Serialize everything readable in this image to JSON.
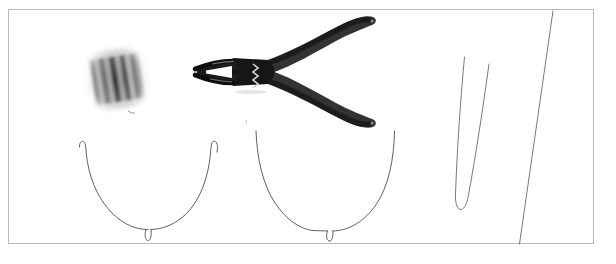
{
  "scene": {
    "title": "Jewellery wire-working materials laid out on a white surface",
    "background_color": "#ffffff",
    "frame_color": "#b9bcbe",
    "alt_text": "Photograph of a spool of wire, a pair of black needle-nose pliers, two U-shaped hooked underwire forms and two long straight wire strands on a plain white background."
  },
  "objects": [
    {
      "id": "wire-spool",
      "label": "Spool of wire",
      "color_dark": "#3c3c3c",
      "color_mid": "#8b8b8b",
      "color_light": "#cfcfcf"
    },
    {
      "id": "needle-nose-pliers",
      "label": "Needle-nose pliers",
      "color_body": "#232323",
      "color_handle": "#3a3a3a",
      "color_spring": "#e2e2e2"
    },
    {
      "id": "underwire-left",
      "label": "U-shaped hooked wire form, left",
      "color_stroke": "#5a5a5a"
    },
    {
      "id": "underwire-right",
      "label": "U-shaped hooked wire form, right",
      "color_stroke": "#5a5a5a"
    },
    {
      "id": "wire-hairpin",
      "label": "Hairpin-bent wire strand",
      "color_stroke": "#6a6a6a"
    },
    {
      "id": "wire-straight",
      "label": "Long straight wire strand",
      "color_stroke": "#6a6a6a"
    }
  ]
}
